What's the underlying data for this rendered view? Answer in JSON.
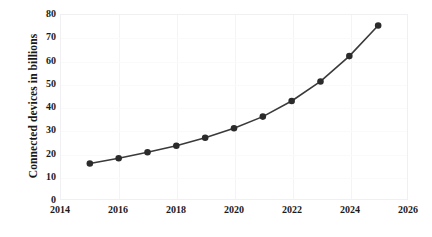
{
  "chart_data": {
    "type": "line",
    "title": "",
    "subtitle": "",
    "xlabel": "",
    "ylabel": "Connected devices in billions",
    "x": [
      2015,
      2016,
      2017,
      2018,
      2019,
      2020,
      2021,
      2022,
      2023,
      2024,
      2025
    ],
    "values": [
      15.41,
      17.68,
      20.35,
      23.14,
      26.66,
      30.73,
      35.82,
      42.62,
      51.11,
      62.12,
      75.44
    ],
    "series": [
      {
        "name": "Connected devices",
        "values": [
          15.41,
          17.68,
          20.35,
          23.14,
          26.66,
          30.73,
          35.82,
          42.62,
          51.11,
          62.12,
          75.44
        ]
      }
    ],
    "xlim": [
      2014,
      2026
    ],
    "ylim": [
      0,
      80
    ],
    "xticks": [
      2014,
      2016,
      2018,
      2020,
      2022,
      2024,
      2026
    ],
    "yticks": [
      0,
      10,
      20,
      30,
      40,
      50,
      60,
      70,
      80
    ],
    "xtick_labels": [
      "2014",
      "2016",
      "2018",
      "2020",
      "2022",
      "2024",
      "2026"
    ],
    "ytick_labels": [
      "0",
      "10",
      "20",
      "30",
      "40",
      "50",
      "60",
      "70",
      "80"
    ],
    "grid": false,
    "legend": false,
    "legend_position": "none",
    "line_color": "#3a3a3a",
    "marker_color": "#2b2b2b",
    "marker": "circle",
    "background_color": "#ffffff",
    "plot_border_color": "#f0f0f2",
    "annotations": []
  }
}
